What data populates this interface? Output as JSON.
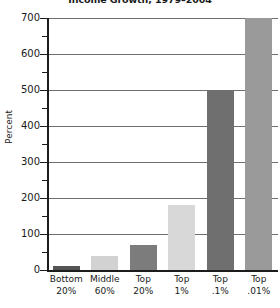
{
  "chart_data": {
    "type": "bar",
    "title": "Income Growth, 1979–2004",
    "xlabel": "",
    "ylabel": "Percent",
    "categories": [
      "Bottom 20%",
      "Middle 60%",
      "Top 20%",
      "Top 1%",
      "Top .1%",
      "Top .01%"
    ],
    "category_lines": [
      [
        "Bottom",
        "20%"
      ],
      [
        "Middle",
        "60%"
      ],
      [
        "Top",
        "20%"
      ],
      [
        "Top",
        "1%"
      ],
      [
        "Top",
        ".1%"
      ],
      [
        "Top",
        ".01%"
      ]
    ],
    "values": [
      10,
      40,
      70,
      180,
      500,
      700
    ],
    "bar_colors": [
      "#555555",
      "#d2d2d2",
      "#7c7c7c",
      "#d8d8d8",
      "#6f6f6f",
      "#9a9a9a"
    ],
    "ylim": [
      0,
      700
    ],
    "ytick_values": [
      0,
      100,
      200,
      300,
      400,
      500,
      600,
      700
    ],
    "ytick_labels": [
      "0",
      "100",
      "200",
      "300",
      "400",
      "500",
      "600",
      "700"
    ],
    "yminor_values": [
      50,
      150,
      250,
      350,
      450,
      550,
      650
    ],
    "grid": true,
    "grid_axis": "y",
    "legend": "none"
  },
  "colors": {
    "axis": "#1c1c1c",
    "grid": "#6f6f6f",
    "text": "#1a1a1a",
    "background": "#ffffff"
  }
}
